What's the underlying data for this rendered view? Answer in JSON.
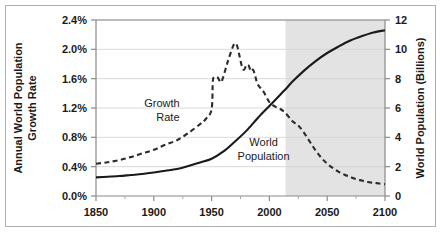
{
  "chart_data": {
    "type": "line",
    "title": "",
    "xlabel": "",
    "grid": "horizontal",
    "legend_position": "inline-annotations",
    "xlim": [
      1850,
      2100
    ],
    "xticks": [
      1850,
      1900,
      1950,
      2000,
      2050,
      2100
    ],
    "xtick_labels": [
      "1850",
      "1900",
      "1950",
      "2000",
      "2050",
      "2100"
    ],
    "left_axis": {
      "label_line1": "Annual World Population",
      "label_line2": "Growth Rate",
      "ylim": [
        0.0,
        2.4
      ],
      "ticks": [
        0.0,
        0.4,
        0.8,
        1.2,
        1.6,
        2.0,
        2.4
      ],
      "tick_labels": [
        "0.0%",
        "0.4%",
        "0.8%",
        "1.2%",
        "1.6%",
        "2.0%",
        "2.4%"
      ],
      "unit": "percent"
    },
    "right_axis": {
      "label": "World Population (Billions)",
      "ylim": [
        0,
        12
      ],
      "ticks": [
        0,
        2,
        4,
        6,
        8,
        10,
        12
      ],
      "tick_labels": [
        "0",
        "2",
        "4",
        "6",
        "8",
        "10",
        "12"
      ],
      "unit": "billions"
    },
    "projection_shading": {
      "start_year": 2014,
      "end_year": 2100,
      "color": "#e3e3e3"
    },
    "series": [
      {
        "name": "Growth Rate",
        "axis": "left",
        "style": "dashed",
        "color": "#2b2b2b",
        "annotation": {
          "line1": "Growth",
          "line2": "Rate",
          "x": 1907,
          "y": 1.22
        },
        "points": [
          [
            1850,
            0.44
          ],
          [
            1860,
            0.46
          ],
          [
            1870,
            0.49
          ],
          [
            1880,
            0.53
          ],
          [
            1890,
            0.58
          ],
          [
            1900,
            0.63
          ],
          [
            1910,
            0.7
          ],
          [
            1920,
            0.76
          ],
          [
            1930,
            0.86
          ],
          [
            1940,
            0.98
          ],
          [
            1945,
            1.05
          ],
          [
            1950,
            1.18
          ],
          [
            1951,
            1.55
          ],
          [
            1952,
            1.62
          ],
          [
            1955,
            1.62
          ],
          [
            1958,
            1.55
          ],
          [
            1960,
            1.62
          ],
          [
            1963,
            1.78
          ],
          [
            1965,
            1.88
          ],
          [
            1968,
            2.02
          ],
          [
            1970,
            2.08
          ],
          [
            1972,
            2.05
          ],
          [
            1974,
            1.92
          ],
          [
            1976,
            1.78
          ],
          [
            1978,
            1.72
          ],
          [
            1980,
            1.78
          ],
          [
            1982,
            1.78
          ],
          [
            1984,
            1.7
          ],
          [
            1986,
            1.72
          ],
          [
            1988,
            1.62
          ],
          [
            1990,
            1.52
          ],
          [
            1995,
            1.42
          ],
          [
            2000,
            1.28
          ],
          [
            2005,
            1.22
          ],
          [
            2010,
            1.18
          ],
          [
            2014,
            1.13
          ],
          [
            2020,
            1.02
          ],
          [
            2025,
            0.96
          ],
          [
            2030,
            0.86
          ],
          [
            2035,
            0.74
          ],
          [
            2040,
            0.62
          ],
          [
            2045,
            0.52
          ],
          [
            2050,
            0.44
          ],
          [
            2055,
            0.38
          ],
          [
            2060,
            0.33
          ],
          [
            2065,
            0.29
          ],
          [
            2070,
            0.26
          ],
          [
            2075,
            0.23
          ],
          [
            2080,
            0.21
          ],
          [
            2085,
            0.19
          ],
          [
            2090,
            0.18
          ],
          [
            2095,
            0.17
          ],
          [
            2100,
            0.16
          ]
        ]
      },
      {
        "name": "World Population",
        "axis": "right",
        "style": "solid",
        "color": "#1a1a1a",
        "annotation": {
          "line1": "World",
          "line2": "Population",
          "x": 1995,
          "y_billions": 3.4
        },
        "points": [
          [
            1850,
            1.27
          ],
          [
            1860,
            1.31
          ],
          [
            1870,
            1.36
          ],
          [
            1880,
            1.43
          ],
          [
            1890,
            1.5
          ],
          [
            1900,
            1.6
          ],
          [
            1910,
            1.72
          ],
          [
            1920,
            1.84
          ],
          [
            1930,
            2.05
          ],
          [
            1940,
            2.28
          ],
          [
            1950,
            2.54
          ],
          [
            1960,
            3.02
          ],
          [
            1970,
            3.7
          ],
          [
            1980,
            4.44
          ],
          [
            1990,
            5.32
          ],
          [
            2000,
            6.14
          ],
          [
            2010,
            6.96
          ],
          [
            2014,
            7.28
          ],
          [
            2020,
            7.8
          ],
          [
            2030,
            8.55
          ],
          [
            2040,
            9.2
          ],
          [
            2050,
            9.75
          ],
          [
            2060,
            10.2
          ],
          [
            2070,
            10.6
          ],
          [
            2080,
            10.9
          ],
          [
            2090,
            11.15
          ],
          [
            2100,
            11.3
          ]
        ]
      }
    ]
  }
}
